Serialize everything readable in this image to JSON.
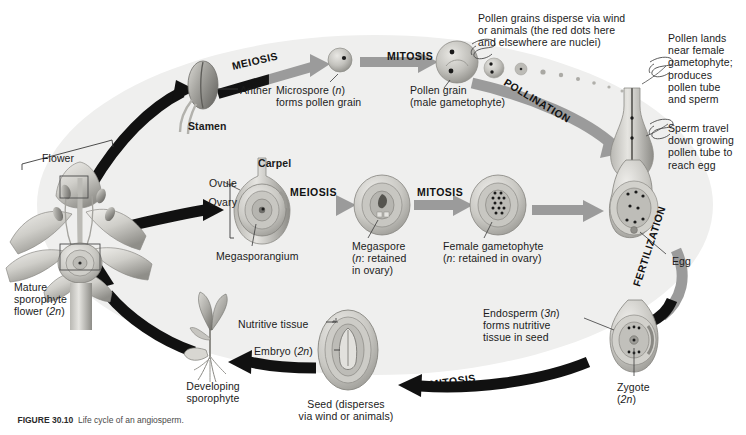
{
  "figure": {
    "caption_label": "FIGURE 30.10",
    "caption_text": "  Life cycle of an angiosperm."
  },
  "background": {
    "ellipse_fill": "#efefee",
    "page_fill": "#ffffff",
    "arrow_black": "#111111",
    "arrow_gray": "#9b9b9b",
    "structure_gray": "#b9b8b4",
    "structure_dark": "#7f7e7a",
    "nuclei_color": "#1a1a1a"
  },
  "stage_words": [
    {
      "id": "meiosis-top",
      "text": "MEIOSIS",
      "x": 232,
      "y": 60,
      "rot": -13
    },
    {
      "id": "mitosis-top",
      "text": "MITOSIS",
      "x": 387,
      "y": 50,
      "rot": 0
    },
    {
      "id": "pollination",
      "text": "POLLINATION",
      "x": 505,
      "y": 75,
      "rot": 31
    },
    {
      "id": "meiosis-mid",
      "text": "MEIOSIS",
      "x": 290,
      "y": 186,
      "rot": 0
    },
    {
      "id": "mitosis-mid",
      "text": "MITOSIS",
      "x": 417,
      "y": 186,
      "rot": 0
    },
    {
      "id": "fertilization",
      "text": "FERTILIZATION",
      "x": 636,
      "y": 280,
      "rot": -72
    },
    {
      "id": "mitosis-bottom",
      "text": "MITOSIS",
      "x": 430,
      "y": 378,
      "rot": -8
    }
  ],
  "labels": [
    {
      "id": "flower",
      "x": 42,
      "y": 152,
      "w": 70,
      "align": "left",
      "bold": false,
      "lines": [
        "Flower"
      ]
    },
    {
      "id": "anther",
      "x": 240,
      "y": 84,
      "w": 60,
      "align": "left",
      "bold": false,
      "lines": [
        "Anther"
      ]
    },
    {
      "id": "stamen",
      "x": 188,
      "y": 120,
      "w": 60,
      "align": "left",
      "bold": true,
      "lines": [
        "Stamen"
      ]
    },
    {
      "id": "microspore",
      "x": 276,
      "y": 84,
      "w": 104,
      "align": "left",
      "bold": false,
      "lines": [
        "Microspore (n)",
        "forms pollen grain"
      ],
      "italic_idx": [
        0
      ]
    },
    {
      "id": "pollen-grain",
      "x": 410,
      "y": 84,
      "w": 110,
      "align": "left",
      "bold": false,
      "lines": [
        "Pollen grain",
        "(male gametophyte)"
      ]
    },
    {
      "id": "pollen-disperse",
      "x": 478,
      "y": 12,
      "w": 176,
      "align": "left",
      "bold": false,
      "lines": [
        "Pollen grains disperse via wind",
        "or animals (the red dots here",
        "and elsewhere are nuclei)"
      ]
    },
    {
      "id": "pollen-lands",
      "x": 668,
      "y": 32,
      "w": 80,
      "align": "left",
      "bold": false,
      "lines": [
        "Pollen lands",
        "near female",
        "gametophyte;",
        "produces",
        "pollen tube",
        "and sperm"
      ]
    },
    {
      "id": "sperm-travel",
      "x": 668,
      "y": 122,
      "w": 80,
      "align": "left",
      "bold": false,
      "lines": [
        "Sperm travel",
        "down growing",
        "pollen tube to",
        "reach egg"
      ]
    },
    {
      "id": "carpel",
      "x": 258,
      "y": 157,
      "w": 60,
      "align": "left",
      "bold": true,
      "lines": [
        "Carpel"
      ]
    },
    {
      "id": "ovule",
      "x": 197,
      "y": 177,
      "w": 40,
      "align": "right",
      "bold": false,
      "lines": [
        "Ovule"
      ]
    },
    {
      "id": "ovary",
      "x": 197,
      "y": 196,
      "w": 40,
      "align": "right",
      "bold": false,
      "lines": [
        "Ovary"
      ]
    },
    {
      "id": "megasporangium",
      "x": 216,
      "y": 250,
      "w": 110,
      "align": "left",
      "bold": false,
      "lines": [
        "Megasporangium"
      ]
    },
    {
      "id": "megaspore",
      "x": 352,
      "y": 240,
      "w": 86,
      "align": "left",
      "bold": false,
      "lines": [
        "Megaspore",
        "(n: retained",
        "in ovary)"
      ],
      "italic_idx": [
        1
      ]
    },
    {
      "id": "female-gametophyte",
      "x": 443,
      "y": 240,
      "w": 130,
      "align": "left",
      "bold": false,
      "lines": [
        "Female gametophyte",
        "(n: retained in ovary)"
      ],
      "italic_idx": [
        1
      ]
    },
    {
      "id": "egg",
      "x": 672,
      "y": 255,
      "w": 40,
      "align": "left",
      "bold": false,
      "lines": [
        "Egg"
      ]
    },
    {
      "id": "endosperm",
      "x": 483,
      "y": 307,
      "w": 96,
      "align": "left",
      "bold": false,
      "lines": [
        "Endosperm (3n)",
        "forms nutritive",
        "tissue in seed"
      ],
      "italic_idx": [
        0
      ]
    },
    {
      "id": "zygote",
      "x": 617,
      "y": 381,
      "w": 60,
      "align": "left",
      "bold": false,
      "lines": [
        "Zygote",
        "(2n)"
      ],
      "italic_idx": [
        1
      ]
    },
    {
      "id": "nutritive-tissue",
      "x": 238,
      "y": 318,
      "w": 96,
      "align": "left",
      "bold": false,
      "lines": [
        "Nutritive tissue"
      ]
    },
    {
      "id": "embryo",
      "x": 254,
      "y": 345,
      "w": 80,
      "align": "left",
      "bold": false,
      "lines": [
        "Embryo (2n)"
      ],
      "italic_idx": [
        0
      ]
    },
    {
      "id": "seed",
      "x": 288,
      "y": 398,
      "w": 116,
      "align": "center",
      "bold": false,
      "lines": [
        "Seed (disperses",
        "via wind or animals)"
      ]
    },
    {
      "id": "developing-sporophyte",
      "x": 168,
      "y": 380,
      "w": 90,
      "align": "center",
      "bold": false,
      "lines": [
        "Developing",
        "sporophyte"
      ]
    },
    {
      "id": "mature-sporophyte",
      "x": 14,
      "y": 281,
      "w": 78,
      "align": "left",
      "bold": false,
      "lines": [
        "Mature",
        "sporophyte",
        "flower (2n)"
      ],
      "italic_idx": [
        2
      ]
    }
  ],
  "structures": [
    {
      "id": "anther-structure",
      "name": "anther",
      "cx": 203,
      "cy": 85
    },
    {
      "id": "microspore-structure",
      "name": "microspore",
      "cx": 340,
      "cy": 60
    },
    {
      "id": "pollen-grain-structure",
      "name": "pollen-grain",
      "cx": 457,
      "cy": 62
    },
    {
      "id": "pollen-tube-structure",
      "name": "pollen-tube",
      "cx": 632,
      "cy": 110
    },
    {
      "id": "ovule-structure",
      "name": "ovule-in-carpel",
      "cx": 262,
      "cy": 205
    },
    {
      "id": "megaspore-structure",
      "name": "megaspore-ovule",
      "cx": 382,
      "cy": 205
    },
    {
      "id": "gametophyte-structure",
      "name": "female-gametophyte",
      "cx": 498,
      "cy": 205
    },
    {
      "id": "fertilized-structure",
      "name": "ovule-with-egg",
      "cx": 634,
      "cy": 205
    },
    {
      "id": "zygote-structure",
      "name": "zygote-endosperm",
      "cx": 634,
      "cy": 340
    },
    {
      "id": "seed-structure",
      "name": "seed-with-embryo",
      "cx": 348,
      "cy": 350
    },
    {
      "id": "seedling-structure",
      "name": "developing-sporophyte",
      "cx": 210,
      "cy": 345
    },
    {
      "id": "flower-structure",
      "name": "mature-flower",
      "cx": 80,
      "cy": 215
    }
  ]
}
